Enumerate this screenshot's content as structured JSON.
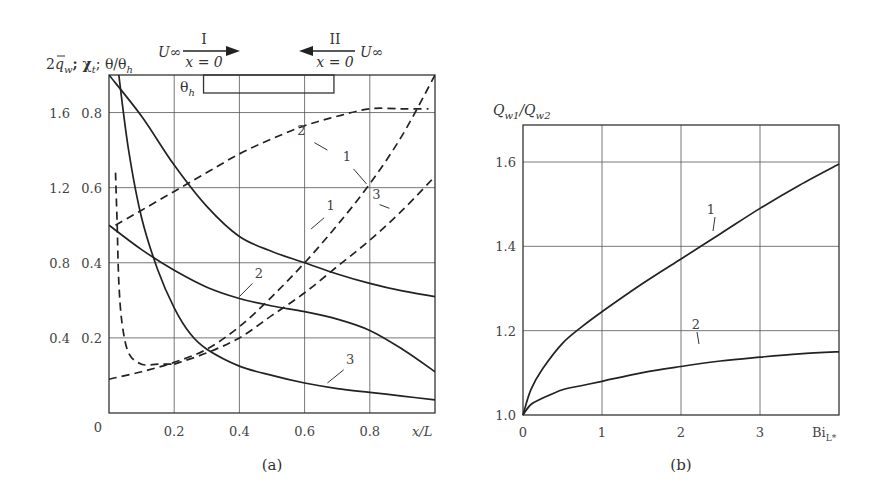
{
  "chart_data": [
    {
      "id": "a",
      "type": "line",
      "caption": "(a)",
      "ylabel": "2q̄_w; χ_t; θ/θ_h",
      "xlabel": "x/L",
      "xlim": [
        0,
        1.0
      ],
      "ylim_inner": [
        0,
        0.9
      ],
      "ylim_outer": [
        0,
        1.8
      ],
      "xticks": [
        "0.2",
        "0.4",
        "0.6",
        "0.8"
      ],
      "origin_label": "0",
      "yticks_outer": [
        "0.4",
        "0.8",
        "1.2",
        "1.6"
      ],
      "yticks_inner": [
        "0.2",
        "0.4",
        "0.6",
        "0.8"
      ],
      "grid": true,
      "annotations": {
        "flow_I": {
          "label": "I",
          "velocity": "U∞",
          "position": "x = 0",
          "direction": "right"
        },
        "flow_II": {
          "label": "II",
          "velocity": "U∞",
          "position": "x = 0",
          "direction": "left"
        },
        "heated_section": "θ_h"
      },
      "series": [
        {
          "name": "1",
          "style": "solid",
          "x": [
            0,
            0.1,
            0.2,
            0.3,
            0.4,
            0.5,
            0.6,
            0.7,
            0.8,
            0.9,
            1.0
          ],
          "y": [
            0.9,
            0.79,
            0.66,
            0.55,
            0.47,
            0.43,
            0.4,
            0.37,
            0.345,
            0.325,
            0.31
          ]
        },
        {
          "name": "2",
          "style": "solid",
          "x": [
            0,
            0.1,
            0.2,
            0.3,
            0.4,
            0.5,
            0.6,
            0.7,
            0.8,
            0.9,
            1.0
          ],
          "y": [
            0.5,
            0.435,
            0.38,
            0.335,
            0.305,
            0.285,
            0.27,
            0.25,
            0.22,
            0.17,
            0.11
          ]
        },
        {
          "name": "3",
          "style": "solid",
          "x": [
            0.03,
            0.06,
            0.1,
            0.15,
            0.2,
            0.25,
            0.3,
            0.4,
            0.5,
            0.6,
            0.7,
            0.8,
            0.9,
            1.0
          ],
          "y": [
            0.9,
            0.7,
            0.52,
            0.38,
            0.28,
            0.21,
            0.17,
            0.125,
            0.1,
            0.08,
            0.065,
            0.055,
            0.045,
            0.035
          ]
        },
        {
          "name": "1",
          "style": "dashed",
          "x": [
            0,
            0.1,
            0.2,
            0.3,
            0.4,
            0.5,
            0.6,
            0.7,
            0.8,
            0.9,
            1.0
          ],
          "y": [
            0.09,
            0.11,
            0.135,
            0.17,
            0.23,
            0.31,
            0.4,
            0.5,
            0.61,
            0.74,
            0.9
          ]
        },
        {
          "name": "2",
          "style": "dashed",
          "x": [
            0.02,
            0.1,
            0.2,
            0.3,
            0.4,
            0.5,
            0.6,
            0.7,
            0.8,
            0.9,
            0.98
          ],
          "y": [
            0.5,
            0.54,
            0.59,
            0.64,
            0.69,
            0.73,
            0.765,
            0.79,
            0.81,
            0.81,
            0.81
          ]
        },
        {
          "name": "3",
          "style": "dashed",
          "x": [
            0.2,
            0.3,
            0.4,
            0.5,
            0.6,
            0.7,
            0.8,
            0.9,
            1.0
          ],
          "y": [
            0.13,
            0.16,
            0.2,
            0.26,
            0.32,
            0.39,
            0.46,
            0.54,
            0.63
          ]
        },
        {
          "name": "θ/θ_h near x=0",
          "style": "dashed",
          "x": [
            0.02,
            0.025,
            0.03,
            0.04,
            0.06,
            0.1,
            0.15,
            0.2
          ],
          "y": [
            0.64,
            0.5,
            0.35,
            0.24,
            0.16,
            0.13,
            0.13,
            0.13
          ]
        }
      ]
    },
    {
      "id": "b",
      "type": "line",
      "caption": "(b)",
      "ylabel": "Q_w1/Q_w2",
      "xlabel": "Bi_L*",
      "xlim": [
        0,
        4
      ],
      "ylim": [
        1.0,
        1.69
      ],
      "xticks": [
        "0",
        "1",
        "2",
        "3"
      ],
      "yticks": [
        "1.0",
        "1.2",
        "1.4",
        "1.6"
      ],
      "grid": true,
      "series": [
        {
          "name": "1",
          "style": "solid",
          "x": [
            0,
            0.1,
            0.25,
            0.5,
            0.75,
            1.0,
            1.5,
            2.0,
            2.5,
            3.0,
            3.5,
            4.0
          ],
          "y": [
            1.0,
            1.06,
            1.11,
            1.17,
            1.21,
            1.245,
            1.31,
            1.37,
            1.43,
            1.49,
            1.545,
            1.595
          ]
        },
        {
          "name": "2",
          "style": "solid",
          "x": [
            0,
            0.1,
            0.25,
            0.5,
            0.75,
            1.0,
            1.5,
            2.0,
            2.5,
            3.0,
            3.5,
            4.0
          ],
          "y": [
            1.0,
            1.025,
            1.04,
            1.06,
            1.07,
            1.08,
            1.1,
            1.115,
            1.128,
            1.137,
            1.145,
            1.15
          ]
        }
      ]
    }
  ],
  "labels": {
    "a_ylabel_main": "2",
    "a_ylabel_q": "q",
    "a_ylabel_w": "w",
    "a_ylabel_chi": "; χ",
    "a_ylabel_t": "t",
    "a_ylabel_theta": "; θ/θ",
    "a_ylabel_h": "h",
    "U_inf": "U∞",
    "flow_I": "I",
    "flow_II": "II",
    "x_eq_0": "x = 0",
    "theta_h": "θ",
    "theta_h_sub": "h",
    "x_over_L": "x/L",
    "b_ylabel_Q": "Q",
    "b_ylabel_sub1": "w1",
    "b_ylabel_slash": "/Q",
    "b_ylabel_sub2": "w2",
    "bi": "Bi",
    "bi_sub": "L*"
  }
}
